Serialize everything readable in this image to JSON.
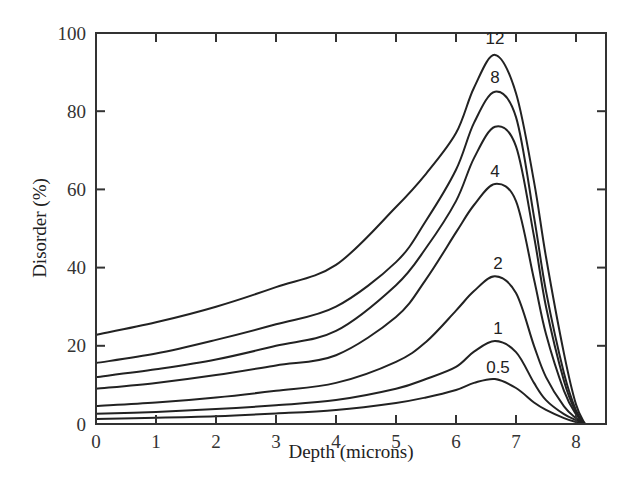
{
  "chart_data": {
    "type": "line",
    "title": "",
    "xlabel": "Depth (microns)",
    "ylabel": "Disorder (%)",
    "xlim": [
      0,
      8.5
    ],
    "ylim": [
      0,
      100
    ],
    "xticks": [
      0,
      1,
      2,
      3,
      4,
      5,
      6,
      7,
      8
    ],
    "yticks": [
      0,
      20,
      40,
      60,
      80,
      100
    ],
    "grid": false,
    "legend": "inline curve labels near peaks",
    "x": [
      0,
      1,
      2,
      3,
      4,
      5,
      5.5,
      6,
      6.3,
      6.65,
      7,
      7.3,
      7.5,
      7.8,
      8.0,
      8.15
    ],
    "series": [
      {
        "name": "12",
        "label": "12",
        "values": [
          22.8,
          26,
          30,
          35,
          40.7,
          55.5,
          64,
          74.4,
          86,
          94.4,
          84.6,
          62,
          42.7,
          18,
          5,
          0
        ]
      },
      {
        "name": "8",
        "label": "8",
        "values": [
          15.6,
          18,
          21.5,
          25.5,
          30,
          41.4,
          52,
          65,
          77,
          85,
          78.5,
          53,
          34,
          13,
          3.5,
          0
        ]
      },
      {
        "name": "6",
        "label": "",
        "values": [
          12.0,
          14,
          16.5,
          20,
          23.8,
          35.5,
          45,
          57,
          68,
          76,
          71,
          48,
          30,
          11,
          3,
          0
        ]
      },
      {
        "name": "4",
        "label": "4",
        "values": [
          9.0,
          10.5,
          12.5,
          15,
          17.6,
          27.4,
          37,
          49,
          56,
          61.4,
          57,
          37,
          23,
          8.5,
          2.5,
          0
        ]
      },
      {
        "name": "2",
        "label": "2",
        "values": [
          4.6,
          5.5,
          6.8,
          8.5,
          10.5,
          15.9,
          21,
          29,
          34,
          37.8,
          33.5,
          20,
          12,
          4.5,
          1.5,
          0
        ]
      },
      {
        "name": "1",
        "label": "1",
        "values": [
          2.6,
          3.1,
          3.8,
          4.8,
          6.1,
          9.0,
          11.5,
          14.6,
          18.5,
          21.2,
          18.4,
          10.5,
          6.1,
          2.5,
          1,
          0
        ]
      },
      {
        "name": "0.5",
        "label": "0.5",
        "values": [
          1.3,
          1.6,
          2.0,
          2.7,
          3.6,
          5.4,
          6.8,
          8.7,
          10.5,
          11.5,
          9.2,
          5.5,
          3.6,
          1.5,
          0.5,
          0
        ]
      }
    ],
    "label_positions": [
      {
        "text": "12",
        "x": 6.65,
        "y": 98.5
      },
      {
        "text": "8",
        "x": 6.65,
        "y": 88.5
      },
      {
        "text": "4",
        "x": 6.65,
        "y": 64.5
      },
      {
        "text": "2",
        "x": 6.7,
        "y": 41
      },
      {
        "text": "1",
        "x": 6.7,
        "y": 24.5
      },
      {
        "text": "0.5",
        "x": 6.7,
        "y": 14.5
      }
    ]
  },
  "axes": {
    "xlabel": "Depth (microns)",
    "ylabel": "Disorder (%)"
  }
}
